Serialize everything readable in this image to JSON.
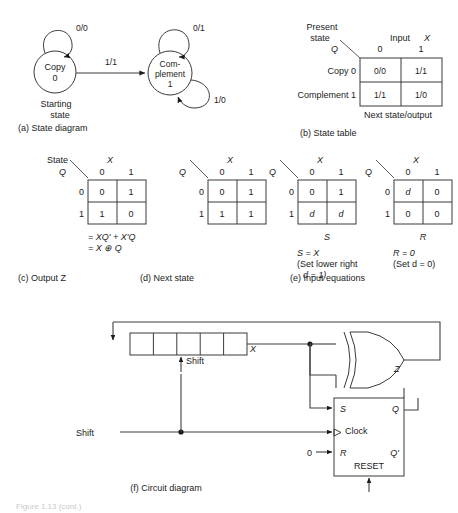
{
  "figure": {
    "caption_bottom": "Figure 1.13 (cont.)",
    "panels": {
      "a": "(a)  State diagram",
      "b": "(b)  State table",
      "c": "(c)  Output Z",
      "d": "(d)  Next state",
      "e": "(e)  Input equations",
      "f": "(f)  Circuit diagram"
    }
  },
  "state_diagram": {
    "states": [
      {
        "name_line1": "Copy",
        "name_line2": "0"
      },
      {
        "name_line1": "Com-",
        "name_line2": "plement",
        "name_line3": "1"
      }
    ],
    "starting_label_line1": "Starting",
    "starting_label_line2": "state",
    "transitions": [
      {
        "label": "0/0",
        "note": "copy self loop"
      },
      {
        "label": "1/1",
        "note": "copy to complement"
      },
      {
        "label": "0/1",
        "note": "complement self loop top"
      },
      {
        "label": "1/0",
        "note": "complement self loop bottom"
      }
    ]
  },
  "state_table": {
    "present_state_label_line1": "Present",
    "present_state_label_line2": "state",
    "q_symbol": "Q",
    "input_label": "Input",
    "input_symbol": "X",
    "col_headers": [
      "0",
      "1"
    ],
    "rows": [
      {
        "label": "Copy 0",
        "cells": [
          "0/0",
          "1/1"
        ]
      },
      {
        "label": "Complement 1",
        "cells": [
          "1/1",
          "1/0"
        ]
      }
    ],
    "footer": "Next state/output"
  },
  "kmaps": [
    {
      "id": "output-z",
      "corner_label": "State",
      "row_var": "Q",
      "col_var": "X",
      "col_headers": [
        "0",
        "1"
      ],
      "row_headers": [
        "0",
        "1"
      ],
      "cells": [
        [
          "0",
          "1"
        ],
        [
          "1",
          "0"
        ]
      ],
      "under_label": "",
      "equations": [
        "= XQ' + X'Q",
        "= X ⊕ Q"
      ]
    },
    {
      "id": "next-state",
      "corner_label": "",
      "row_var": "Q",
      "col_var": "X",
      "col_headers": [
        "0",
        "1"
      ],
      "row_headers": [
        "0",
        "1"
      ],
      "cells": [
        [
          "0",
          "1"
        ],
        [
          "1",
          "1"
        ]
      ],
      "under_label": "",
      "equations": []
    },
    {
      "id": "input-s",
      "corner_label": "",
      "row_var": "Q",
      "col_var": "X",
      "col_headers": [
        "0",
        "1"
      ],
      "row_headers": [
        "0",
        "1"
      ],
      "cells": [
        [
          "0",
          "1"
        ],
        [
          "d",
          "d"
        ]
      ],
      "under_label": "S",
      "equations": [
        "S = X",
        "(Set lower right",
        "d = 1)"
      ]
    },
    {
      "id": "input-r",
      "corner_label": "",
      "row_var": "Q",
      "col_var": "X",
      "col_headers": [
        "0",
        "1"
      ],
      "row_headers": [
        "0",
        "1"
      ],
      "cells": [
        [
          "d",
          "0"
        ],
        [
          "0",
          "0"
        ]
      ],
      "under_label": "R",
      "equations": [
        "R = 0",
        "(Set d = 0)"
      ]
    }
  ],
  "circuit": {
    "shift_register": {
      "cells": 5,
      "output_label": "X",
      "shift_label": "Shift"
    },
    "shift_input_label": "Shift",
    "xor_output_label": "Z",
    "flipflop": {
      "s_label": "S",
      "clock_label": "Clock",
      "r_label": "R",
      "q_label": "Q",
      "qbar_label": "Q'",
      "reset_label": "RESET",
      "r_input_value": "0"
    }
  }
}
